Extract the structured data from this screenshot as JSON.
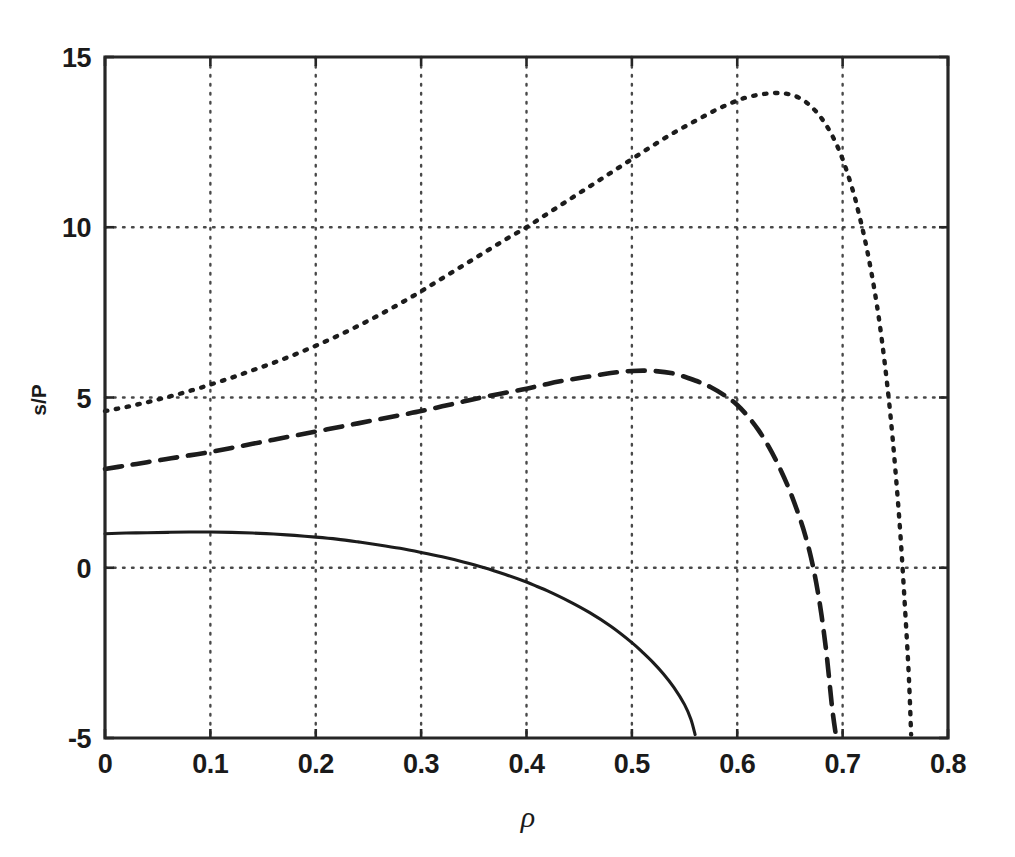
{
  "figure": {
    "background_color": "#ffffff",
    "ink_color": "#1a1a1a",
    "y_axis_title": "s/P",
    "x_axis_title": "ρ"
  },
  "chart_data": {
    "type": "line",
    "title": "",
    "subtitle": "",
    "xlabel": "ρ",
    "ylabel": "s/P",
    "xlim": [
      0,
      0.8
    ],
    "ylim": [
      -5,
      15
    ],
    "xticks": [
      0,
      0.1,
      0.2,
      0.3,
      0.4,
      0.5,
      0.6,
      0.7,
      0.8
    ],
    "xticklabels": [
      "0",
      "0.1",
      "0.2",
      "0.3",
      "0.4",
      "0.5",
      "0.6",
      "0.7",
      "0.8"
    ],
    "yticks": [
      -5,
      0,
      5,
      10,
      15
    ],
    "yticklabels": [
      "-5",
      "0",
      "5",
      "10",
      "15"
    ],
    "grid": true,
    "grid_style": "dotted",
    "legend": "none",
    "series": [
      {
        "name": "dotted-curve",
        "linestyle": "dotted",
        "color": "#1c1c1c",
        "x": [
          0.0,
          0.01,
          0.02,
          0.03,
          0.04,
          0.05,
          0.06,
          0.07,
          0.08,
          0.09,
          0.1,
          0.12,
          0.14,
          0.16,
          0.18,
          0.2,
          0.22,
          0.24,
          0.26,
          0.28,
          0.3,
          0.32,
          0.34,
          0.36,
          0.38,
          0.4,
          0.42,
          0.44,
          0.46,
          0.48,
          0.5,
          0.52,
          0.54,
          0.56,
          0.58,
          0.6,
          0.61,
          0.62,
          0.63,
          0.64,
          0.65,
          0.66,
          0.67,
          0.68,
          0.69,
          0.7,
          0.71,
          0.715,
          0.72,
          0.725,
          0.73,
          0.735,
          0.74,
          0.745,
          0.75,
          0.755,
          0.76,
          0.763,
          0.765
        ],
        "y": [
          4.6,
          4.66,
          4.72,
          4.79,
          4.86,
          4.94,
          5.02,
          5.1,
          5.19,
          5.28,
          5.38,
          5.58,
          5.8,
          6.02,
          6.26,
          6.52,
          6.8,
          7.1,
          7.42,
          7.76,
          8.12,
          8.5,
          8.88,
          9.26,
          9.64,
          10.0,
          10.4,
          10.8,
          11.2,
          11.6,
          12.0,
          12.4,
          12.78,
          13.12,
          13.45,
          13.72,
          13.82,
          13.89,
          13.93,
          13.94,
          13.9,
          13.78,
          13.55,
          13.2,
          12.7,
          12.0,
          11.05,
          10.45,
          9.8,
          9.05,
          8.2,
          7.2,
          6.0,
          4.6,
          2.9,
          0.9,
          -1.6,
          -3.3,
          -4.9
        ]
      },
      {
        "name": "dashed-curve",
        "linestyle": "dashed",
        "color": "#1c1c1c",
        "x": [
          0.0,
          0.02,
          0.04,
          0.06,
          0.08,
          0.1,
          0.12,
          0.14,
          0.16,
          0.18,
          0.2,
          0.22,
          0.24,
          0.26,
          0.28,
          0.3,
          0.32,
          0.34,
          0.36,
          0.38,
          0.4,
          0.42,
          0.44,
          0.46,
          0.48,
          0.5,
          0.52,
          0.54,
          0.56,
          0.575,
          0.59,
          0.6,
          0.61,
          0.62,
          0.63,
          0.64,
          0.65,
          0.66,
          0.665,
          0.67,
          0.675,
          0.68,
          0.685,
          0.69,
          0.694
        ],
        "y": [
          2.9,
          3.0,
          3.1,
          3.2,
          3.3,
          3.4,
          3.52,
          3.64,
          3.76,
          3.88,
          4.0,
          4.12,
          4.24,
          4.36,
          4.48,
          4.6,
          4.74,
          4.88,
          5.02,
          5.14,
          5.26,
          5.4,
          5.52,
          5.62,
          5.72,
          5.78,
          5.78,
          5.7,
          5.5,
          5.3,
          5.02,
          4.78,
          4.45,
          4.05,
          3.55,
          2.95,
          2.25,
          1.4,
          0.9,
          0.3,
          -0.45,
          -1.4,
          -2.6,
          -4.1,
          -5.0
        ]
      },
      {
        "name": "solid-curve",
        "linestyle": "solid",
        "color": "#1c1c1c",
        "x": [
          0.0,
          0.02,
          0.04,
          0.06,
          0.08,
          0.1,
          0.12,
          0.14,
          0.16,
          0.18,
          0.2,
          0.22,
          0.24,
          0.26,
          0.28,
          0.3,
          0.32,
          0.34,
          0.36,
          0.38,
          0.4,
          0.41,
          0.42,
          0.44,
          0.46,
          0.48,
          0.5,
          0.51,
          0.52,
          0.53,
          0.54,
          0.55,
          0.556,
          0.56
        ],
        "y": [
          1.0,
          1.02,
          1.03,
          1.04,
          1.05,
          1.05,
          1.04,
          1.02,
          0.99,
          0.95,
          0.9,
          0.84,
          0.76,
          0.67,
          0.57,
          0.45,
          0.32,
          0.17,
          0.0,
          -0.2,
          -0.42,
          -0.55,
          -0.68,
          -0.98,
          -1.32,
          -1.72,
          -2.2,
          -2.48,
          -2.78,
          -3.12,
          -3.52,
          -4.02,
          -4.45,
          -4.9
        ]
      }
    ]
  }
}
